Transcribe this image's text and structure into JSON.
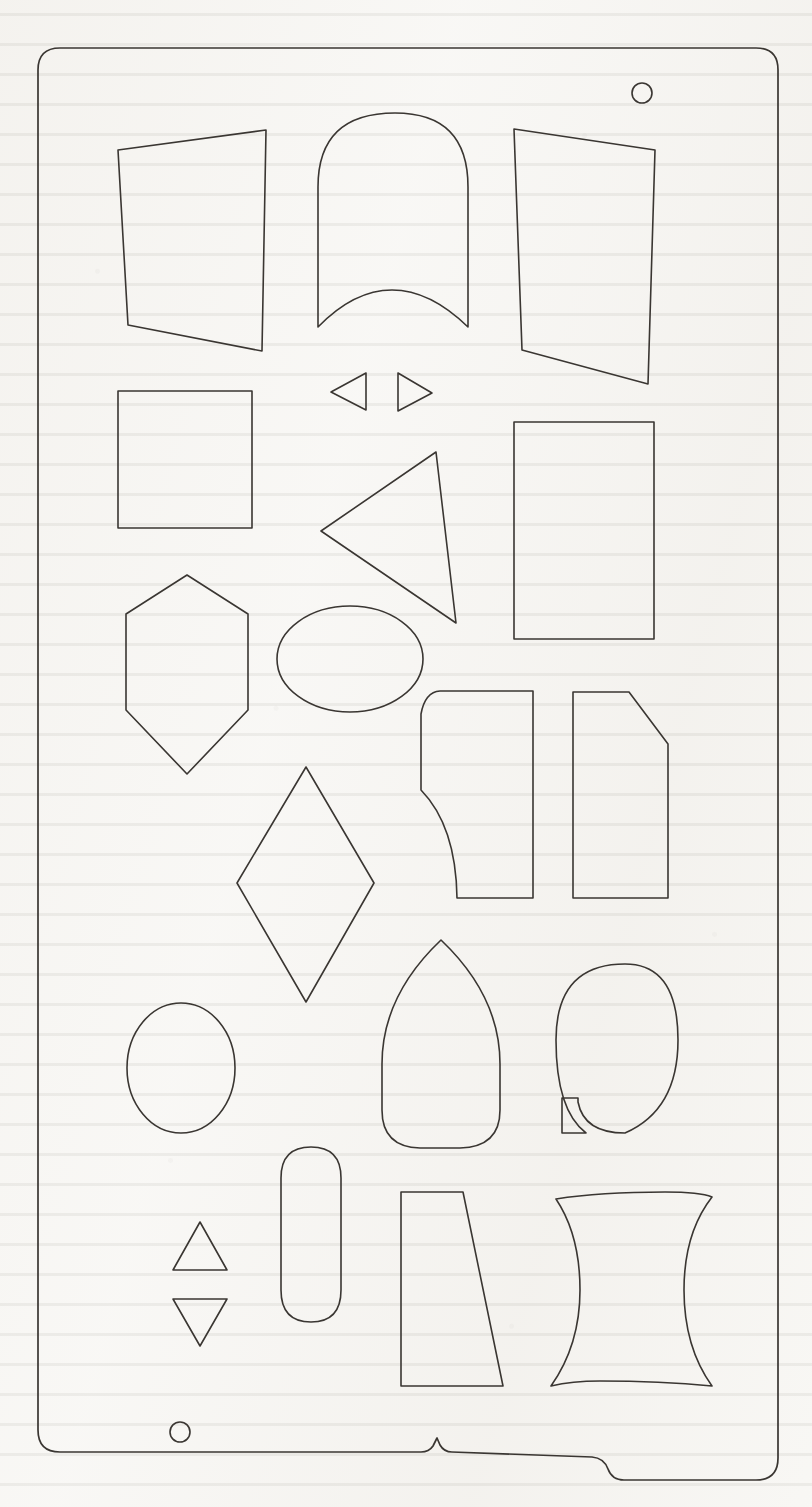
{
  "sheet": {
    "title": "Geometric Template Stencil Sheet",
    "media": "scanned drafting template page",
    "width_px": 812,
    "height_px": 1507,
    "background_color": "#f7f6f3",
    "stroke_color": "#3a3632",
    "stroke_width": 1.6,
    "fill": "none"
  },
  "outline": {
    "name": "stencil-body-outline",
    "corner_radius": 22,
    "bounds": {
      "x": 38,
      "y": 48,
      "width": 740,
      "height": 1432
    },
    "bottom_tab": {
      "description": "raised step with small peak notch on lower edge",
      "peak_x": 437,
      "step_right_x": 624
    }
  },
  "holes": [
    {
      "name": "hanging-hole-top-right",
      "cx": 642,
      "cy": 93,
      "r": 10
    },
    {
      "name": "hanging-hole-bottom-left",
      "cx": 180,
      "cy": 1432,
      "r": 10
    }
  ],
  "shapes": [
    {
      "index": 1,
      "name": "trapezoid-left-top",
      "label": "Trapezoid (left leaning)",
      "kind": "polygon"
    },
    {
      "index": 2,
      "name": "tombstone-concave-base",
      "label": "Arch with concave base",
      "kind": "path"
    },
    {
      "index": 3,
      "name": "quadrilateral-right-top",
      "label": "Skewed quadrilateral",
      "kind": "polygon"
    },
    {
      "index": 4,
      "name": "small-triangle-left",
      "label": "Small triangle pointing left",
      "kind": "polygon"
    },
    {
      "index": 5,
      "name": "small-triangle-right",
      "label": "Small triangle pointing right",
      "kind": "polygon"
    },
    {
      "index": 6,
      "name": "square-left",
      "label": "Square",
      "kind": "polygon"
    },
    {
      "index": 7,
      "name": "large-triangle-left",
      "label": "Large triangle pointing left",
      "kind": "polygon"
    },
    {
      "index": 8,
      "name": "rectangle-right",
      "label": "Upright rectangle",
      "kind": "polygon"
    },
    {
      "index": 9,
      "name": "hexagon-vertical",
      "label": "Vertical hexagon",
      "kind": "polygon"
    },
    {
      "index": 10,
      "name": "ellipse-horizontal",
      "label": "Horizontal ellipse",
      "kind": "ellipse"
    },
    {
      "index": 11,
      "name": "scurve-panel-left",
      "label": "Panel with S-curved edge",
      "kind": "path"
    },
    {
      "index": 12,
      "name": "chamfered-panel-right",
      "label": "Panel with chamfered corner",
      "kind": "polygon"
    },
    {
      "index": 13,
      "name": "rhombus-diamond",
      "label": "Diamond / rhombus",
      "kind": "polygon"
    },
    {
      "index": 14,
      "name": "ellipse-upright-left",
      "label": "Upright ellipse",
      "kind": "ellipse"
    },
    {
      "index": 15,
      "name": "pointed-arch",
      "label": "Pointed arch (ogive)",
      "kind": "path"
    },
    {
      "index": 16,
      "name": "oval-with-notch",
      "label": "Oval with rectangular notch",
      "kind": "path"
    },
    {
      "index": 17,
      "name": "stadium-pill-vertical",
      "label": "Vertical stadium / pill",
      "kind": "path"
    },
    {
      "index": 18,
      "name": "triangle-up-small",
      "label": "Small triangle pointing up",
      "kind": "polygon"
    },
    {
      "index": 19,
      "name": "triangle-down-small",
      "label": "Small triangle pointing down",
      "kind": "polygon"
    },
    {
      "index": 20,
      "name": "tapered-quad-bottom",
      "label": "Tapered quadrilateral",
      "kind": "polygon"
    },
    {
      "index": 21,
      "name": "wave-scurve-bottom",
      "label": "Wavy S-curve band",
      "kind": "path"
    }
  ],
  "geometry": {
    "outline_path": "M 60 48 L 756 48 Q 778 48 778 70 L 778 1458 Q 778 1480 756 1480 L 624 1480 Q 612 1480 608 1469 Q 604 1458 592 1457 L 452 1452 Q 444 1452 440 1445 L 437 1438 L 433 1446 Q 429 1452 421 1452 L 60 1452 Q 38 1452 38 1430 L 38 70 Q 38 48 60 48 Z",
    "trapezoid_left_top": "118,150 266,130 262,351 128,325",
    "tombstone_concave_base": "M 318 327 L 318 187 Q 318 113 395 113 Q 468 113 468 187 L 468 327 Q 430 290 392 290 Q 354 290 318 327 Z",
    "quadrilateral_right_top": "514,129 655,150 648,384 522,350",
    "small_triangle_left": "331,392 366,373 366,410",
    "small_triangle_right": "432,393 398,373 398,411",
    "square_left": "118,391 252,391 252,528 118,528",
    "large_triangle_left": "321,531 436,452 456,623",
    "rectangle_right": "514,422 654,422 654,639",
    "rectangle_right_full": "514,422 654,422 654,639 514,639",
    "hexagon_vertical": "187,575 248,614 248,710 187,774 126,710 126,614",
    "ellipse_horizontal": {
      "cx": 350,
      "cy": 659,
      "rx": 73,
      "ry": 53
    },
    "scurve_panel_left": "M 440 691 Q 425 692 421 714 L 421 790 Q 456 826 457 898 L 533 898 L 533 691 Z",
    "chamfered_panel_right": "573,692 629,692 668,744 668,898 573,898",
    "rhombus_diamond": "306,767 374,883 306,1002 237,883",
    "ellipse_upright_left": {
      "cx": 181,
      "cy": 1068,
      "rx": 54,
      "ry": 65
    },
    "pointed_arch": "M 441 940 Q 500 996 500 1064 L 500 1110 Q 500 1147 460 1148 L 420 1148 Q 382 1147 382 1110 L 382 1064 Q 382 996 441 940 Z",
    "oval_with_notch": "M 625 964 Q 678 964 678 1040 Q 678 1110 625 1133 Q 584 1133 578 1102 L 578 1098 L 562 1098 L 562 1133 L 586 1133 Q 556 1110 556 1040 Q 556 964 625 964 Z",
    "stadium_pill_vertical": "M 281 1178 Q 281 1147 311 1147 Q 341 1147 341 1178 L 341 1290 Q 341 1322 311 1322 Q 281 1322 281 1290 Z",
    "triangle_up_small": "200,1222 227,1270 173,1270",
    "triangle_down_small": "200,1346 227,1299 173,1299",
    "tapered_quad_bottom": "401,1192 463,1192 503,1386 401,1386",
    "wave_scurve_bottom": "M 556 1199 Q 600 1192 665 1192 Q 700 1192 712 1197 Q 684 1233 684 1290 Q 684 1347 712 1386 Q 660 1381 600 1381 Q 572 1381 551 1386 Q 580 1345 580 1290 Q 580 1235 556 1199 Z"
  }
}
